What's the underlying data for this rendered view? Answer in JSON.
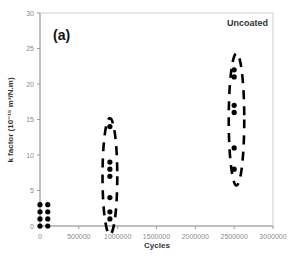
{
  "chart_data": {
    "type": "scatter",
    "title": "",
    "panel_label": "(a)",
    "annotation": "Uncoated",
    "xlabel": "Cycles",
    "ylabel": "k factor (10⁻¹⁵ m³/N.m)",
    "xlim": [
      0,
      3000000
    ],
    "ylim": [
      0,
      30
    ],
    "x_ticks": [
      0,
      500000,
      1000000,
      1500000,
      2000000,
      2500000,
      3000000
    ],
    "x_tick_labels": [
      "0",
      "500000",
      "1000000",
      "1500000",
      "2000000",
      "2500000",
      "3000000"
    ],
    "y_ticks": [
      0,
      5,
      10,
      15,
      20,
      25,
      30
    ],
    "y_tick_labels": [
      "0",
      "5",
      "10",
      "15",
      "20",
      "25",
      "30"
    ],
    "grid": false,
    "legend": null,
    "series": [
      {
        "name": "Uncoated",
        "marker": "circle",
        "color": "#000000",
        "points": [
          {
            "x": 0,
            "y": 0
          },
          {
            "x": 0,
            "y": 1
          },
          {
            "x": 0,
            "y": 2
          },
          {
            "x": 0,
            "y": 3
          },
          {
            "x": 100000,
            "y": 0
          },
          {
            "x": 100000,
            "y": 1
          },
          {
            "x": 100000,
            "y": 2
          },
          {
            "x": 100000,
            "y": 3
          },
          {
            "x": 900000,
            "y": 14
          },
          {
            "x": 900000,
            "y": 9
          },
          {
            "x": 900000,
            "y": 8
          },
          {
            "x": 900000,
            "y": 7
          },
          {
            "x": 900000,
            "y": 4
          },
          {
            "x": 900000,
            "y": 2
          },
          {
            "x": 900000,
            "y": 1
          },
          {
            "x": 2500000,
            "y": 22
          },
          {
            "x": 2500000,
            "y": 21
          },
          {
            "x": 2500000,
            "y": 17
          },
          {
            "x": 2500000,
            "y": 16
          },
          {
            "x": 2500000,
            "y": 11
          },
          {
            "x": 2500000,
            "y": 8
          }
        ]
      }
    ],
    "highlight_ellipses": [
      {
        "cx": 900000,
        "cy": 7,
        "ry_units": 8.2,
        "rx_cycles": 95000,
        "style": "dashed"
      },
      {
        "cx": 2530000,
        "cy": 15,
        "ry_units": 9.3,
        "rx_cycles": 100000,
        "style": "dashed"
      }
    ]
  }
}
